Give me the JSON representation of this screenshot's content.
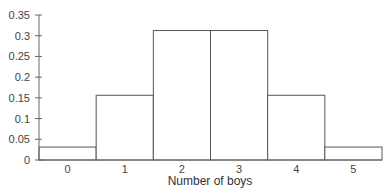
{
  "chart_data": {
    "type": "bar",
    "title": "",
    "xlabel": "Number of boys",
    "ylabel": "",
    "categories": [
      "0",
      "1",
      "2",
      "3",
      "4",
      "5"
    ],
    "values": [
      0.03125,
      0.15625,
      0.3125,
      0.3125,
      0.15625,
      0.03125
    ],
    "ylim": [
      0,
      0.35
    ],
    "yticks": [
      "0",
      "0.05",
      "0.1",
      "0.15",
      "0.2",
      "0.25",
      "0.3",
      "0.35"
    ],
    "grid": false,
    "legend": null,
    "bar_style": {
      "fill": "#ffffff",
      "stroke": "#555555"
    }
  }
}
